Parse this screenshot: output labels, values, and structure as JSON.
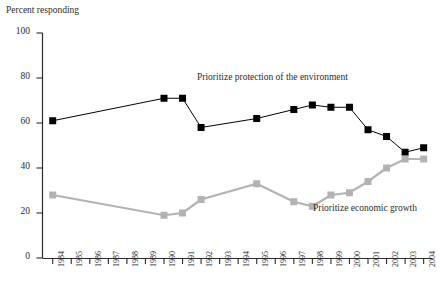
{
  "chart_data": {
    "type": "line",
    "title": "",
    "ylabel": "Percent responding",
    "xlabel": "",
    "ylim": [
      0,
      100
    ],
    "yticks": [
      0,
      20,
      40,
      60,
      80,
      100
    ],
    "grid": false,
    "legend_position": "inline-annotations",
    "categories": [
      "1984",
      "1985",
      "1986",
      "1987",
      "1988",
      "1989",
      "1990",
      "1991",
      "1992",
      "1993",
      "1994",
      "1995",
      "1996",
      "1997",
      "1998",
      "1999",
      "2000",
      "2001",
      "2002",
      "2003",
      "2004"
    ],
    "series": [
      {
        "name": "Prioritize protection of the environment",
        "color": "#000000",
        "marker": "square",
        "values": [
          61,
          null,
          null,
          null,
          null,
          null,
          71,
          71,
          58,
          null,
          null,
          62,
          null,
          66,
          68,
          67,
          67,
          57,
          54,
          47,
          49
        ]
      },
      {
        "name": "Prioritize economic growth",
        "color": "#b3b3b3",
        "marker": "square",
        "values": [
          28,
          null,
          null,
          null,
          null,
          null,
          19,
          20,
          26,
          null,
          null,
          33,
          null,
          25,
          23,
          28,
          29,
          34,
          40,
          44,
          44
        ]
      }
    ],
    "annotations": [
      {
        "text": "Prioritize protection of the environment",
        "x": "1993",
        "y": 78
      },
      {
        "text": "Prioritize economic growth",
        "x": "2000",
        "y": 21
      }
    ]
  },
  "colors": {
    "environment_series": "#000000",
    "economy_series": "#b3b3b3",
    "axis": "#2b2b2b",
    "background": "#ffffff"
  }
}
